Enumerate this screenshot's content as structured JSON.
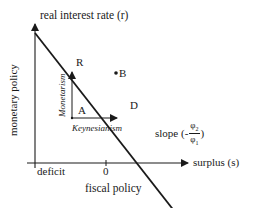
{
  "diagram": {
    "y_axis_label": "real interest rate (r)",
    "y_axis_title": "monetary policy",
    "x_axis_label": "surplus (s)",
    "x_axis_title": "fiscal policy",
    "x_left_label": "deficit",
    "x_zero_label": "0",
    "points": {
      "R": "R",
      "A": "A",
      "B": "B",
      "D": "D"
    },
    "arrows": {
      "vertical": "Monetarism",
      "horizontal": "Keynesianism"
    },
    "slope": {
      "prefix": "slope (-",
      "numerator": "φ",
      "numerator_sub": "2",
      "denominator": "φ",
      "denominator_sub": "1",
      "suffix": ")"
    },
    "colors": {
      "ink": "#1a1a1a",
      "background": "#ffffff"
    }
  }
}
